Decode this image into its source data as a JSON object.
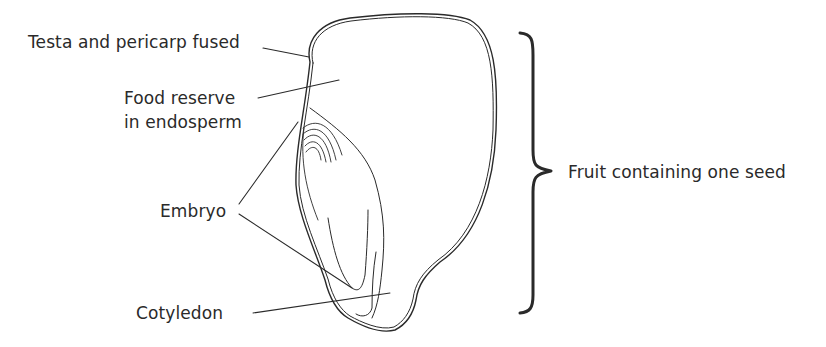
{
  "diagram": {
    "labels": {
      "testa": "Testa and pericarp fused",
      "food_line1": "Food reserve",
      "food_line2": "in endosperm",
      "embryo": "Embryo",
      "cotyledon": "Cotyledon",
      "fruit": "Fruit containing one seed"
    },
    "colors": {
      "line": "#2a2a2a",
      "background": "#ffffff"
    }
  }
}
